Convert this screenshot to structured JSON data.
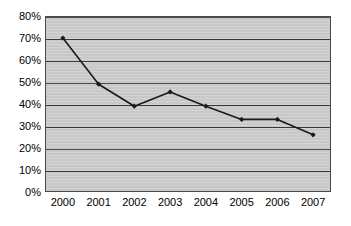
{
  "chart_data": {
    "type": "line",
    "title": "",
    "subtitle": "",
    "xlabel": "",
    "ylabel": "",
    "categories": [
      "2000",
      "2001",
      "2002",
      "2003",
      "2004",
      "2005",
      "2006",
      "2007"
    ],
    "values": [
      70,
      49,
      39,
      45.5,
      39,
      33,
      33,
      26
    ],
    "series": [
      {
        "name": "",
        "values": [
          70,
          49,
          39,
          45.5,
          39,
          33,
          33,
          26
        ]
      }
    ],
    "ylim": [
      0,
      80
    ],
    "ytick_step": 10,
    "ytick_labels": [
      "0%",
      "10%",
      "20%",
      "30%",
      "40%",
      "50%",
      "60%",
      "70%",
      "80%"
    ],
    "ytick_values": [
      0,
      10,
      20,
      30,
      40,
      50,
      60,
      70,
      80
    ],
    "xtick_labels": [
      "2000",
      "2001",
      "2002",
      "2003",
      "2004",
      "2005",
      "2006",
      "2007"
    ],
    "grid": {
      "horizontal": true,
      "vertical": false
    },
    "legend": {
      "visible": false,
      "position": "none"
    },
    "marker": "diamond",
    "colors": {
      "line": "#1a1a1a",
      "marker": "#1a1a1a",
      "plot_background": "#cfcfcf",
      "plot_border": "#4a4a4a",
      "gridline": "#3a3a3a",
      "page_background": "#ffffff",
      "text": "#000000"
    }
  }
}
